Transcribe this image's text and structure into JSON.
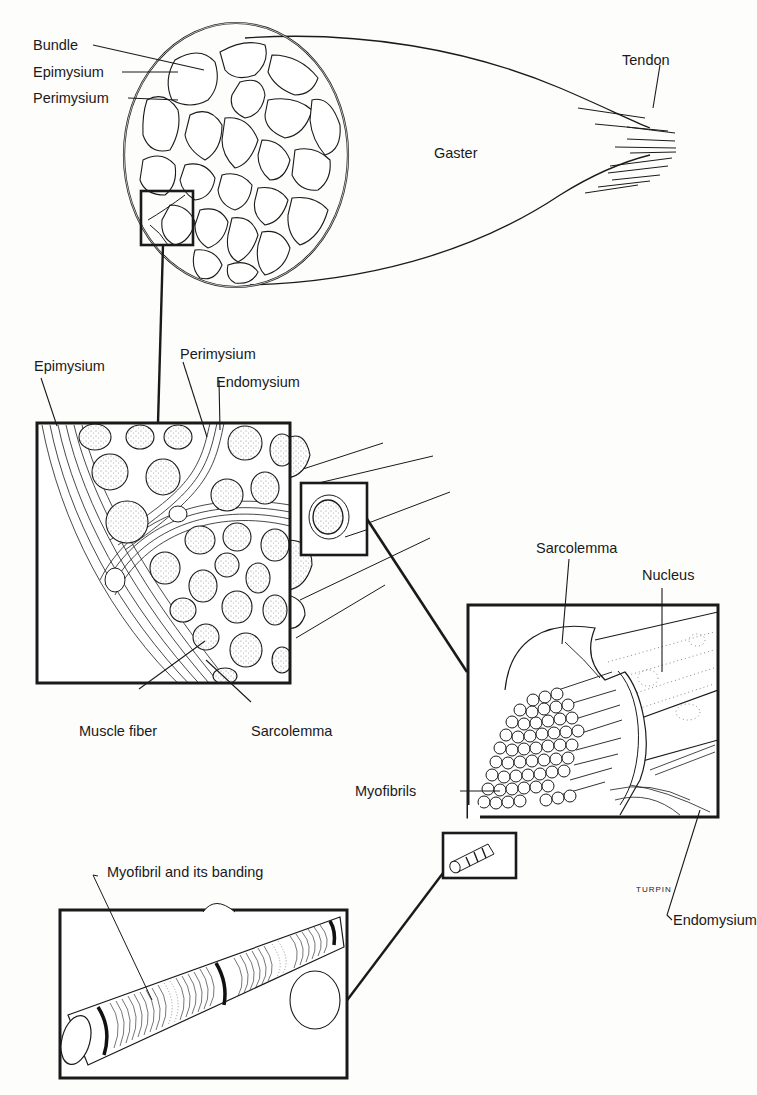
{
  "figure": {
    "panels": [
      {
        "id": "gross",
        "description": "Whole muscle cross-section with tendon"
      },
      {
        "id": "bundle-detail",
        "description": "Magnified bundles (fascicles) with fibers"
      },
      {
        "id": "fiber-detail",
        "description": "Single muscle fiber with myofibrils"
      },
      {
        "id": "myofibril-detail",
        "description": "Single myofibril showing banding"
      }
    ]
  },
  "labels": {
    "gross": {
      "bundle": "Bundle",
      "epimysium": "Epimysium",
      "perimysium": "Perimysium",
      "gaster": "Gaster",
      "tendon": "Tendon"
    },
    "bundle_detail": {
      "epimysium": "Epimysium",
      "perimysium": "Perimysium",
      "endomysium": "Endomysium",
      "muscle_fiber": "Muscle fiber",
      "sarcolemma": "Sarcolemma"
    },
    "fiber_detail": {
      "sarcolemma": "Sarcolemma",
      "nucleus": "Nucleus",
      "myofibrils": "Myofibrils",
      "endomysium": "Endomysium"
    },
    "myofibril_detail": {
      "myofibril_banding": "Myofibril and its banding"
    }
  },
  "signature": "TURPIN",
  "colors": {
    "ink": "#1a1a1a",
    "paper": "#fdfdfc",
    "stipple": "#8a8a8a"
  }
}
